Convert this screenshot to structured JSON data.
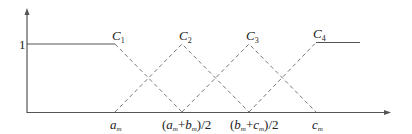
{
  "diagram": {
    "type": "membership-functions",
    "y_axis": {
      "tick_label": "1"
    },
    "x_axis": {
      "ticks": [
        {
          "id": "a",
          "main": "a",
          "sub": "m"
        },
        {
          "id": "ab",
          "prefix": "(",
          "a": "a",
          "a_sub": "m",
          "plus": "+",
          "b": "b",
          "b_sub": "m",
          "suffix": ")/2"
        },
        {
          "id": "bc",
          "prefix": "(",
          "a": "b",
          "a_sub": "m",
          "plus": "+",
          "b": "c",
          "b_sub": "m",
          "suffix": ")/2"
        },
        {
          "id": "c",
          "main": "c",
          "sub": "m"
        }
      ]
    },
    "curves": [
      {
        "name": "C",
        "sub": "1",
        "shape": "left-shoulder"
      },
      {
        "name": "C",
        "sub": "2",
        "shape": "triangle"
      },
      {
        "name": "C",
        "sub": "3",
        "shape": "triangle"
      },
      {
        "name": "C",
        "sub": "4",
        "shape": "right-shoulder"
      }
    ],
    "colors": {
      "axis": "#555555",
      "solid": "#555555",
      "dashed": "#777777",
      "text": "#222222"
    }
  }
}
